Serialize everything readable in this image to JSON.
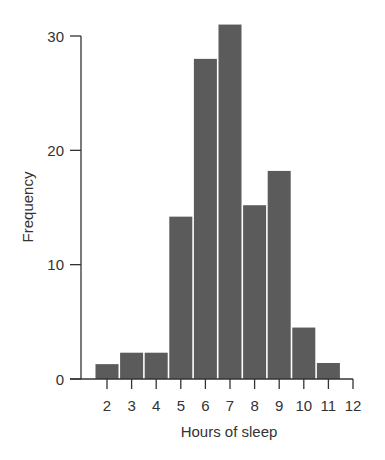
{
  "chart_data": {
    "type": "bar",
    "title": "",
    "xlabel": "Hours of sleep",
    "ylabel": "Frequency",
    "categories": [
      "2",
      "3",
      "4",
      "5",
      "6",
      "7",
      "8",
      "9",
      "10",
      "11"
    ],
    "values": [
      1.3,
      2.3,
      2.3,
      14.2,
      28,
      31,
      15.2,
      18.2,
      4.5,
      1.4
    ],
    "x_ticks": [
      2,
      3,
      4,
      5,
      6,
      7,
      8,
      9,
      10,
      11,
      12
    ],
    "y_ticks": [
      0,
      10,
      20,
      30
    ],
    "ylim": [
      0,
      30
    ],
    "xlim": [
      1,
      12
    ],
    "grid": false,
    "legend": null,
    "bar_color": "#5b5b5b",
    "axis_color": "#333333"
  }
}
